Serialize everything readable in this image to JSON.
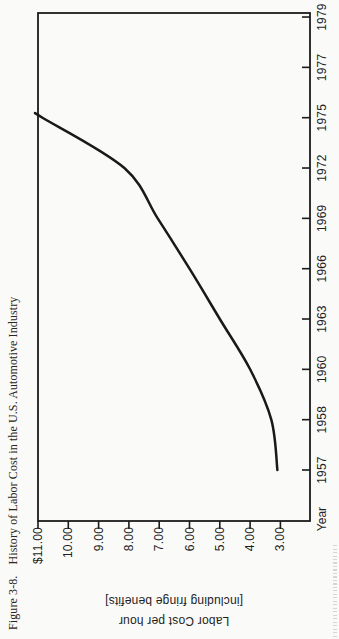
{
  "figure": {
    "caption": {
      "label": "Figure 3-8.",
      "title": "History of Labor Cost in the U.S. Automotive Industry"
    }
  },
  "chart_data": {
    "type": "line",
    "xlabel": "Year",
    "ylabel": "Labor Cost per hour [including fringe benefits]",
    "ylabel_lines": [
      "Labor Cost per hour",
      "[including fringe benefits]"
    ],
    "x_tick_labels": [
      "1957",
      "1958",
      "1960",
      "1963",
      "1966",
      "1969",
      "1972",
      "1975",
      "1977",
      "1979"
    ],
    "x_ticks_equally_spaced": true,
    "y_tick_labels": [
      "$11.00",
      "10.00",
      "9.00",
      "8.00",
      "7.00",
      "6.00",
      "5.00",
      "4.00",
      "3.00"
    ],
    "y_tick_values": [
      11,
      10,
      9,
      8,
      7,
      6,
      5,
      4,
      3
    ],
    "y_axis_top_value": 11,
    "y_axis_bottom_value": 2,
    "grid": false,
    "legend": false,
    "orientation": "figure printed rotated 90 degrees counterclockwise on the page",
    "ink_color": "#1b1b1b",
    "series": [
      {
        "name": "Labor cost per hour (including fringe benefits)",
        "points": [
          {
            "year": "1957",
            "value": 3.1
          },
          {
            "year": "1958",
            "value": 3.3
          },
          {
            "year": "1960",
            "value": 4.0
          },
          {
            "year": "1963",
            "value": 5.0
          },
          {
            "year": "1966",
            "value": 6.0
          },
          {
            "year": "1969",
            "value": 7.05
          },
          {
            "year": "1972",
            "value": 8.15
          },
          {
            "year": "1975",
            "value": 10.85
          }
        ],
        "curve_clipped_at_plot_top": true,
        "curve_top_value": 11.0
      }
    ]
  }
}
